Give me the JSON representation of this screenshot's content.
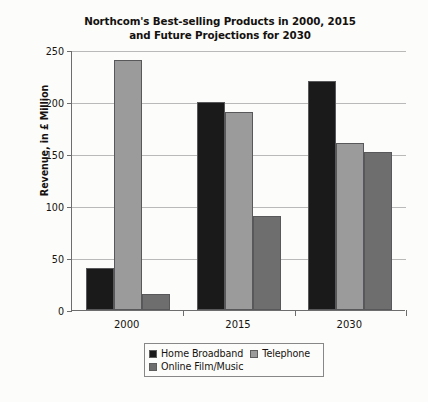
{
  "chart_data": {
    "type": "bar",
    "title": "Northcom's Best-selling Products in 2000, 2015 and Future Projections for 2030",
    "title_line1": "Northcom's Best-selling Products in 2000, 2015",
    "title_line2": "and Future Projections for 2030",
    "xlabel": "",
    "ylabel": "Revenue, in £ Million",
    "categories": [
      "2000",
      "2015",
      "2030"
    ],
    "ylim": [
      0,
      250
    ],
    "yticks": [
      0,
      50,
      100,
      150,
      200,
      250
    ],
    "ytick_labels": [
      "0",
      "50",
      "100",
      "150",
      "200",
      "250"
    ],
    "grid": true,
    "legend_position": "bottom",
    "series": [
      {
        "name": "Home Broadband",
        "color": "#1a1a1a",
        "values": [
          40,
          200,
          220
        ]
      },
      {
        "name": "Telephone",
        "color": "#9b9b9b",
        "values": [
          240,
          190,
          161
        ]
      },
      {
        "name": "Online Film/Music",
        "color": "#6e6e6e",
        "values": [
          15,
          90,
          152
        ]
      }
    ]
  }
}
